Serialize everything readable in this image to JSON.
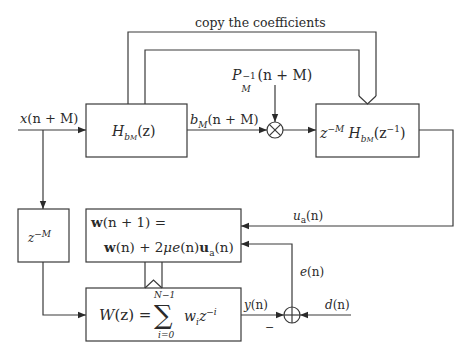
{
  "diagram": {
    "title_label": "copy the coefficients",
    "blocks": [
      {
        "id": "h-bm",
        "label": "H_{b_M}(z)"
      },
      {
        "id": "time-reversed-filter",
        "label": "z^{-M} H_{b_M}(z^{-1})"
      },
      {
        "id": "delay",
        "label": "z^{-M}"
      },
      {
        "id": "weight-update",
        "line1": "w(n + 1) =",
        "line2": "w(n) + 2μe(n)u_a(n)"
      },
      {
        "id": "adaptive-filter",
        "label": "W(z) = Σ_{i=0}^{N−1} w_i z^{−i}"
      }
    ],
    "operators": [
      {
        "id": "multiplier",
        "symbol": "⊗"
      },
      {
        "id": "summer",
        "symbol": "⊕",
        "minus_sign": "−"
      }
    ],
    "signals": {
      "input": "x(n + M)",
      "bm": "b_M(n + M)",
      "p_inverse": "P_M^{-1}(n + M)",
      "ua": "u_a(n)",
      "error": "e(n)",
      "output": "y(n)",
      "desired": "d(n)"
    }
  },
  "text": {
    "copy": "copy the coefficients",
    "x_sym": "x",
    "x_args": "(n + M)",
    "H": "H",
    "b": "b",
    "M": "M",
    "z_arg": "(z)",
    "bm_args": "(n + M)",
    "P": "P",
    "minus_one": "−1",
    "p_args": "(n + M)",
    "z": "z",
    "neg_M": "−M",
    "z_inv_open": "(z",
    "z_inv_close": ")",
    "delay_neg_M": "−M",
    "w_bold": "w",
    "upd1_rest": "(n + 1) =",
    "upd2_a": "(n) + 2",
    "mu": "μ",
    "e_sym": "e",
    "upd2_b": "(n)",
    "u_bold": "u",
    "a_sub": "a",
    "upd2_c": "(n)",
    "W": "W",
    "Wz_eq": "(z) =",
    "sigma": "∑",
    "sum_top": "N−1",
    "sum_bot": "i=0",
    "w_i": "w",
    "i_sub": "i",
    "z_neg_i": "z",
    "neg_i": "−i",
    "u_sym": "u",
    "n_paren": "(n)",
    "e_label": "e",
    "y_label": "y",
    "d_label": "d",
    "minus": "−"
  },
  "colors": {
    "stroke": "#3a3a3a",
    "background": "#ffffff"
  }
}
